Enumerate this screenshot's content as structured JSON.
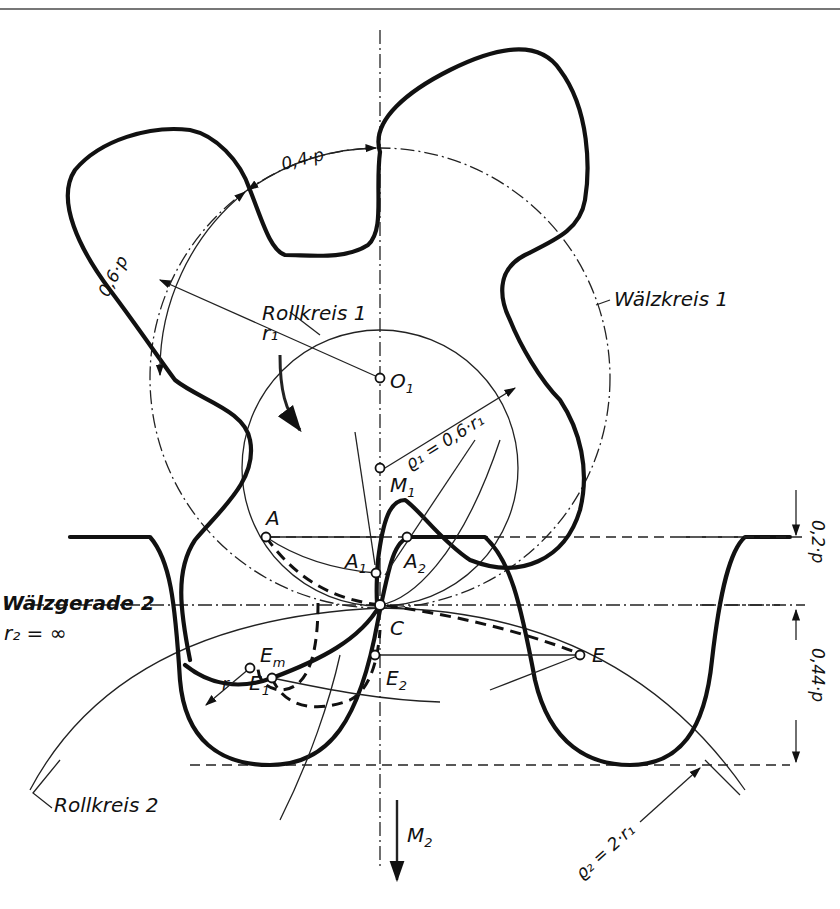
{
  "figure": {
    "type": "gear tooth engagement / cycloidal gear geometry diagram",
    "labels": {
      "rollkreis_1": "Rollkreis 1",
      "rollkreis_2": "Rollkreis 2",
      "waelzkreis_1": "Wälzkreis 1",
      "waelzgerade_2": "Wälzgerade 2",
      "r2_infinity": "r₂ = ∞",
      "r1": "r₁",
      "r": "r"
    },
    "dimensions": {
      "arc_top": "0,4·p",
      "arc_left": "0,6·p",
      "head_height": "0,2·p",
      "foot_depth": "0,44·p",
      "rho1": "ϱ₁ = 0,6·r₁",
      "rho2": "ϱ₂ = 2·r₁"
    },
    "points": [
      {
        "id": "O1",
        "label": "O",
        "sub": "1"
      },
      {
        "id": "M1",
        "label": "M",
        "sub": "1"
      },
      {
        "id": "A",
        "label": "A",
        "sub": ""
      },
      {
        "id": "A1",
        "label": "A",
        "sub": "1"
      },
      {
        "id": "A2",
        "label": "A",
        "sub": "2"
      },
      {
        "id": "C",
        "label": "C",
        "sub": ""
      },
      {
        "id": "E",
        "label": "E",
        "sub": ""
      },
      {
        "id": "E1",
        "label": "E",
        "sub": "1"
      },
      {
        "id": "E2",
        "label": "E",
        "sub": "2"
      },
      {
        "id": "Em",
        "label": "E",
        "sub": "m"
      }
    ],
    "direction_arrow": {
      "label": "M",
      "sub": "2"
    }
  }
}
